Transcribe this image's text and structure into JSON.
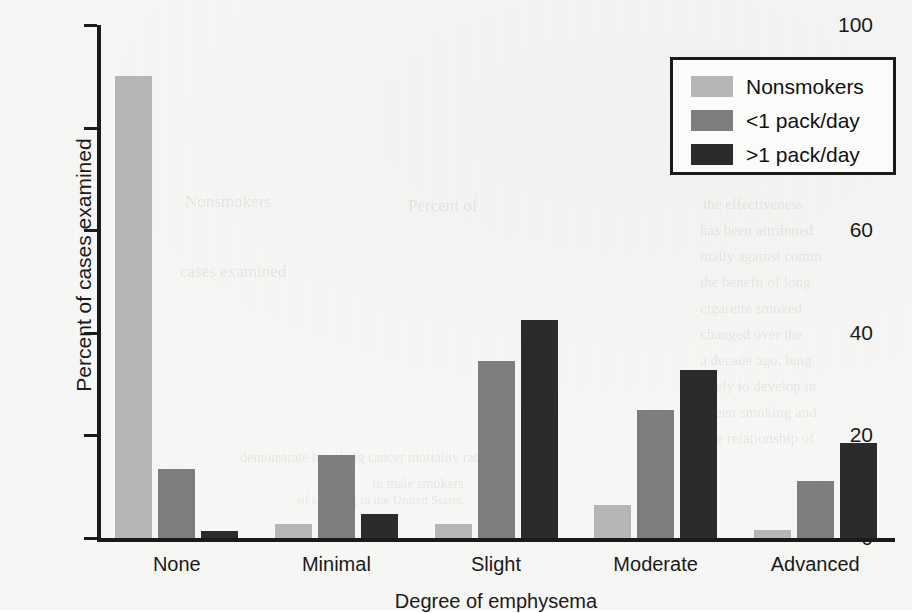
{
  "chart_data": {
    "type": "bar",
    "title": "",
    "xlabel": "Degree of emphysema",
    "ylabel": "Percent of cases examined",
    "categories": [
      "None",
      "Minimal",
      "Slight",
      "Moderate",
      "Advanced"
    ],
    "series": [
      {
        "name": "Nonsmokers",
        "color": "#b5b5b5",
        "values": [
          90.0,
          2.7,
          2.7,
          6.4,
          1.6
        ]
      },
      {
        "name": "<1 pack/day",
        "color": "#7e7e7e",
        "values": [
          13.5,
          16.2,
          34.5,
          25.0,
          11.2
        ]
      },
      {
        "name": ">1 pack/day",
        "color": "#2b2b2b",
        "values": [
          1.3,
          4.7,
          42.5,
          32.7,
          18.5
        ]
      }
    ],
    "ylim": [
      0,
      100
    ],
    "yticks": [
      0,
      20,
      40,
      60,
      80,
      100
    ],
    "ytick_labels": [
      "0",
      "20",
      "40",
      "60",
      "80",
      "100"
    ],
    "grid": false,
    "legend_position": "top-right"
  },
  "legend": {
    "entries": [
      {
        "label": "Nonsmokers"
      },
      {
        "label": "<1 pack/day"
      },
      {
        "label": ">1 pack/day"
      }
    ]
  },
  "bleed_text": [
    {
      "text": "the effectiveness",
      "x": 703,
      "y": 196,
      "size": 15
    },
    {
      "text": "has been attributed",
      "x": 700,
      "y": 222,
      "size": 15
    },
    {
      "text": "mally against comm",
      "x": 700,
      "y": 248,
      "size": 15
    },
    {
      "text": "the benefit of long",
      "x": 700,
      "y": 274,
      "size": 15
    },
    {
      "text": "cigarette smoked",
      "x": 700,
      "y": 300,
      "size": 15
    },
    {
      "text": "changed over the",
      "x": 700,
      "y": 326,
      "size": 15
    },
    {
      "text": "a decade ago, lung",
      "x": 700,
      "y": 352,
      "size": 15
    },
    {
      "text": "likely to develop in",
      "x": 700,
      "y": 378,
      "size": 15
    },
    {
      "text": "tween smoking and",
      "x": 700,
      "y": 404,
      "size": 15
    },
    {
      "text": "The relationship of",
      "x": 700,
      "y": 430,
      "size": 15
    },
    {
      "text": "Nonsmokers",
      "x": 185,
      "y": 192,
      "size": 17
    },
    {
      "text": "Percent of",
      "x": 408,
      "y": 196,
      "size": 17
    },
    {
      "text": "cases examined",
      "x": 180,
      "y": 262,
      "size": 17
    },
    {
      "text": "demonstrate how lung cancer mortality rates",
      "x": 240,
      "y": 450,
      "size": 14
    },
    {
      "text": "in male smokers",
      "x": 372,
      "y": 476,
      "size": 14
    },
    {
      "text": "of smoking in the United States.",
      "x": 298,
      "y": 492,
      "size": 13
    }
  ]
}
